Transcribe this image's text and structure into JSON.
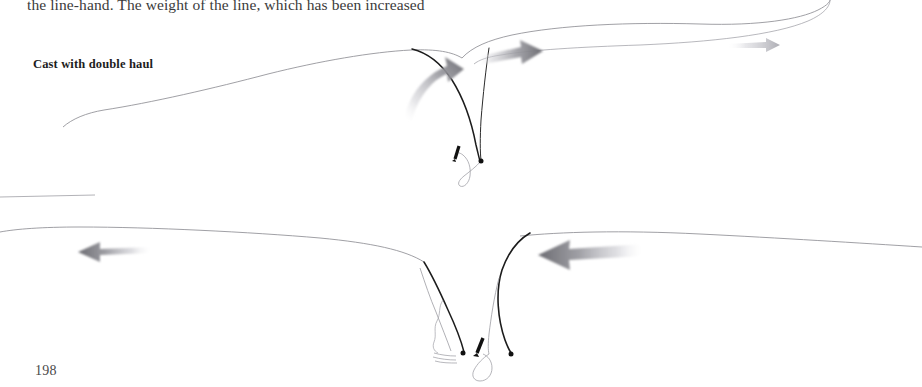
{
  "page": {
    "width": 922,
    "height": 387,
    "background_color": "#ffffff",
    "page_number": "198",
    "body_text_line": "the line-hand. The weight of the line, which has been increased",
    "caption": "Cast with double haul"
  },
  "colors": {
    "line_stroke": "#8a8a90",
    "rod_stroke": "#1c1c1c",
    "arrow_dark": "#6f6f74",
    "arrow_mid": "#9a9aa0",
    "arrow_light": "#d8d8dc",
    "text_body": "#3b3b3b",
    "text_caption": "#1d1d1d",
    "hand_mark": "#111111"
  },
  "figures": [
    {
      "id": "upper-cast-diagram",
      "name": "upper-cast-diagram",
      "description": "Fly rod bent forward with fly line loop unrolling to the right; two motion arrows indicate rod and line-hand direction.",
      "elements": [
        {
          "name": "fly-line-curve",
          "role": "fly-line"
        },
        {
          "name": "rod-blank-curve",
          "role": "rod"
        },
        {
          "name": "line-loop-curve",
          "role": "line-loop"
        },
        {
          "name": "rod-grip-dot",
          "role": "grip-marker"
        },
        {
          "name": "line-hand-mark",
          "role": "hand-marker"
        },
        {
          "name": "rod-motion-arrow",
          "role": "curved-arrow",
          "direction": "up-right"
        },
        {
          "name": "line-motion-arrow",
          "role": "straight-arrow",
          "direction": "right"
        },
        {
          "name": "line-tip-arrow",
          "role": "straight-arrow",
          "direction": "right"
        }
      ]
    },
    {
      "id": "lower-cast-diagram",
      "name": "lower-cast-diagram",
      "description": "Fly rod drawn back with line extending to the left; two motion arrows indicate the back-haul direction.",
      "elements": [
        {
          "name": "fly-line-curve",
          "role": "fly-line"
        },
        {
          "name": "short-line-segment",
          "role": "fly-line"
        },
        {
          "name": "rod-blank-curve",
          "role": "rod"
        },
        {
          "name": "line-loop-curve",
          "role": "line-loop"
        },
        {
          "name": "rod-grip-dot",
          "role": "grip-marker"
        },
        {
          "name": "line-hand-mark",
          "role": "hand-marker"
        },
        {
          "name": "motion-wave-marks",
          "role": "motion-lines"
        },
        {
          "name": "rod-motion-arrow",
          "role": "straight-arrow",
          "direction": "left"
        },
        {
          "name": "line-motion-arrow",
          "role": "straight-arrow",
          "direction": "left"
        }
      ]
    }
  ]
}
